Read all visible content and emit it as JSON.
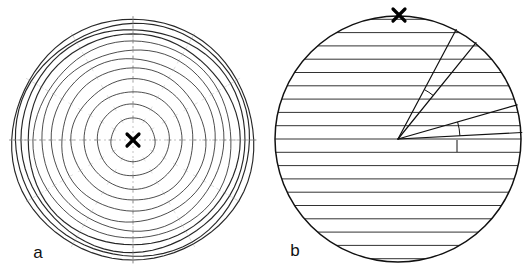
{
  "figure": {
    "caption_present": false,
    "background_color": "#ffffff",
    "ink_color": "#111111",
    "faint_ink_color": "#7a7a7a",
    "width": 530,
    "height": 274
  },
  "panels": [
    {
      "id": "a",
      "label": "a",
      "label_x": 38,
      "label_y": 258,
      "kind": "concentric-ring-fringe-pattern",
      "center": {
        "x": 133,
        "y": 140
      },
      "outer_radius": 122,
      "marker": {
        "name": "center-cross-marker",
        "symbol": "x",
        "x": 133,
        "y": 140,
        "size": 13
      },
      "ring_radii": [
        22,
        36,
        49,
        61,
        72,
        82,
        91,
        99,
        106,
        112,
        117,
        121
      ],
      "ring_count": 12,
      "tick_mark_color": "#8a8a8a",
      "tick_radial_angles_deg": [
        0,
        30,
        60,
        90,
        120,
        150,
        180,
        210,
        240,
        270,
        300,
        330
      ],
      "vertical_axis_visible": true,
      "horizontal_axis_visible": true
    },
    {
      "id": "b",
      "label": "b",
      "label_x": 295,
      "label_y": 256,
      "kind": "straight-fringe-pattern-with-angle-wedges",
      "center": {
        "x": 398,
        "y": 139
      },
      "outer_radius": 123,
      "marker": {
        "name": "top-cross-marker",
        "symbol": "x",
        "x": 399,
        "y": 15,
        "size": 13
      },
      "fringe_orientation": "horizontal",
      "fringe_spacing": 13.3,
      "fringe_count": 19,
      "apex": {
        "x": 398,
        "y": 139
      },
      "rays": [
        {
          "name": "wedge-upper-left-ray",
          "angle_deg": 62,
          "length": 124
        },
        {
          "name": "wedge-upper-right-ray",
          "angle_deg": 51,
          "length": 124
        },
        {
          "name": "wedge-lower-upper-ray",
          "angle_deg": 16,
          "length": 124
        },
        {
          "name": "wedge-lower-lower-ray",
          "angle_deg": 3,
          "length": 124
        }
      ],
      "angle_arcs": [
        {
          "name": "upper-wedge-angle-arc",
          "radius": 56,
          "from_deg": 51,
          "to_deg": 62
        },
        {
          "name": "lower-wedge-angle-arc",
          "radius": 62,
          "from_deg": 3,
          "to_deg": 16
        }
      ]
    }
  ]
}
